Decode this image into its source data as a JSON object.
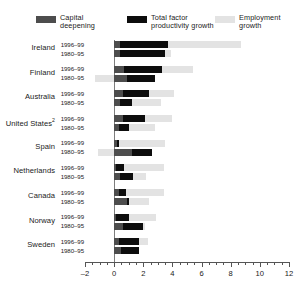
{
  "legend": {
    "items": [
      {
        "label": "Capital\ndeepening",
        "color": "#4d4d4d",
        "name": "capital-deepening"
      },
      {
        "label": "Total factor\nproductivity growth",
        "color": "#0d0d0d",
        "name": "total-factor-productivity-growth"
      },
      {
        "label": "Employment\ngrowth",
        "color": "#e3e3e3",
        "name": "employment-growth"
      }
    ]
  },
  "axis": {
    "ticks": [
      "-2",
      "0",
      "2",
      "4",
      "6",
      "8",
      "10",
      "12"
    ],
    "min": -2,
    "max": 12
  },
  "periods": {
    "recent": "1996–99",
    "earlier": "1980–95"
  },
  "chart_data": {
    "type": "bar",
    "orientation": "horizontal",
    "stacked": true,
    "title": "",
    "xlabel": "",
    "ylabel": "",
    "xlim": [
      -2,
      12
    ],
    "grid": false,
    "legend_position": "top",
    "tick_step": 2,
    "minor_tick_step": 0.5,
    "categories": [
      "Ireland",
      "Finland",
      "Australia",
      "United States",
      "Spain",
      "Netherlands",
      "Canada",
      "Norway",
      "Sweden"
    ],
    "category_footnotes": {
      "United States": "2"
    },
    "subcategories": [
      "1996–99",
      "1980–95"
    ],
    "series": [
      {
        "name": "Capital deepening",
        "color": "#4d4d4d"
      },
      {
        "name": "Total factor productivity growth",
        "color": "#0d0d0d"
      },
      {
        "name": "Employment growth",
        "color": "#e3e3e3"
      }
    ],
    "values": [
      {
        "category": "Ireland",
        "rows": [
          {
            "period": "1996–99",
            "capital_deepening": 0.4,
            "tfp_growth": 3.3,
            "employment_growth": 5.0,
            "total": 8.7
          },
          {
            "period": "1980–95",
            "capital_deepening": 0.4,
            "tfp_growth": 3.1,
            "employment_growth": 0.4,
            "total": 3.9
          }
        ]
      },
      {
        "category": "Finland",
        "rows": [
          {
            "period": "1996–99",
            "capital_deepening": 0.7,
            "tfp_growth": 2.6,
            "employment_growth": 2.1,
            "total": 5.4
          },
          {
            "period": "1980–95",
            "capital_deepening": 0.9,
            "tfp_growth": 1.9,
            "employment_growth": -1.3,
            "total": 1.5
          }
        ]
      },
      {
        "category": "Australia",
        "rows": [
          {
            "period": "1996–99",
            "capital_deepening": 0.6,
            "tfp_growth": 1.8,
            "employment_growth": 1.7,
            "total": 4.1
          },
          {
            "period": "1980–95",
            "capital_deepening": 0.4,
            "tfp_growth": 0.8,
            "employment_growth": 2.0,
            "total": 3.2
          }
        ]
      },
      {
        "category": "United States",
        "rows": [
          {
            "period": "1996–99",
            "capital_deepening": 0.6,
            "tfp_growth": 1.5,
            "employment_growth": 1.9,
            "total": 4.0
          },
          {
            "period": "1980–95",
            "capital_deepening": 0.3,
            "tfp_growth": 0.7,
            "employment_growth": 1.8,
            "total": 2.8
          }
        ]
      },
      {
        "category": "Spain",
        "rows": [
          {
            "period": "1996–99",
            "capital_deepening": 0.2,
            "tfp_growth": 0.1,
            "employment_growth": 3.2,
            "total": 3.5
          },
          {
            "period": "1980–95",
            "capital_deepening": 1.2,
            "tfp_growth": 1.4,
            "employment_growth": -1.1,
            "total": 1.5
          }
        ]
      },
      {
        "category": "Netherlands",
        "rows": [
          {
            "period": "1996–99",
            "capital_deepening": 0.1,
            "tfp_growth": 0.6,
            "employment_growth": 2.7,
            "total": 3.4
          },
          {
            "period": "1980–95",
            "capital_deepening": 0.4,
            "tfp_growth": 0.9,
            "employment_growth": 0.9,
            "total": 2.2
          }
        ]
      },
      {
        "category": "Canada",
        "rows": [
          {
            "period": "1996–99",
            "capital_deepening": 0.3,
            "tfp_growth": 0.5,
            "employment_growth": 2.6,
            "total": 3.4
          },
          {
            "period": "1980–95",
            "capital_deepening": 0.9,
            "tfp_growth": 0.1,
            "employment_growth": 1.4,
            "total": 2.4
          }
        ]
      },
      {
        "category": "Norway",
        "rows": [
          {
            "period": "1996–99",
            "capital_deepening": 0.1,
            "tfp_growth": 0.9,
            "employment_growth": 1.9,
            "total": 2.9
          },
          {
            "period": "1980–95",
            "capital_deepening": 0.6,
            "tfp_growth": 1.4,
            "employment_growth": 0.1,
            "total": 2.1
          }
        ]
      },
      {
        "category": "Sweden",
        "rows": [
          {
            "period": "1996–99",
            "capital_deepening": 0.3,
            "tfp_growth": 1.4,
            "employment_growth": 0.6,
            "total": 2.3
          },
          {
            "period": "1980–95",
            "capital_deepening": 0.5,
            "tfp_growth": 1.2,
            "employment_growth": 0.0,
            "total": 1.7
          }
        ]
      }
    ]
  }
}
